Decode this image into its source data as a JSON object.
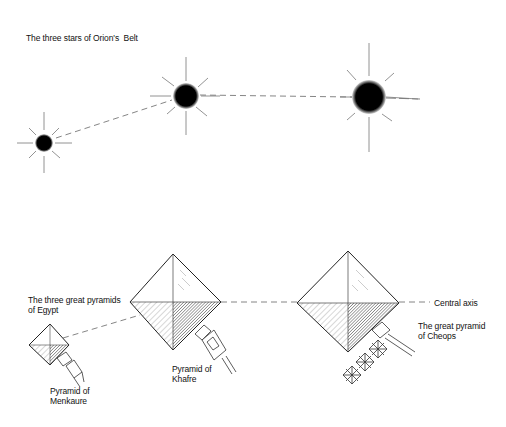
{
  "title": "The three stars of Orion's  Belt",
  "labels": {
    "pyramids_group": "The three great pyramids\nof Egypt",
    "central_axis": "Central axis",
    "cheops": "The great pyramid\nof Cheops",
    "khafre": "Pyramid of\nKhafre",
    "menkaure": "Pyramid of\nMenkaure"
  },
  "stars": [
    {
      "name": "small-star",
      "cx": 44,
      "cy": 143,
      "r": 8
    },
    {
      "name": "middle-star",
      "cx": 186,
      "cy": 96,
      "r": 12
    },
    {
      "name": "large-star",
      "cx": 369,
      "cy": 97,
      "r": 16
    }
  ],
  "colors": {
    "ink": "#111111",
    "line": "#555555",
    "background": "#ffffff"
  }
}
